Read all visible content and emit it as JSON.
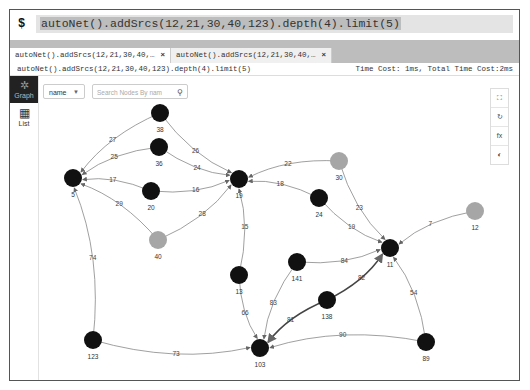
{
  "command_bar": {
    "prompt": "$",
    "query": "autoNet().addSrcs(12,21,30,40,123).depth(4).limit(5)"
  },
  "tabs": [
    {
      "label": "autoNet().addSrcs(12,21,30,40,…",
      "close": "×",
      "active": true
    },
    {
      "label": "autoNet().addSrcs(12,21,30,40,…",
      "close": "×",
      "active": false
    }
  ],
  "info_bar": {
    "query": "autoNet().addSrcs(12,21,30,40,123).depth(4).limit(5)",
    "timing": "Time Cost: 1ms, Total Time Cost:2ms"
  },
  "sidebar": {
    "items": [
      {
        "label": "Graph",
        "icon": "graph-icon",
        "active": true
      },
      {
        "label": "List",
        "icon": "table-icon",
        "active": false
      }
    ]
  },
  "controls": {
    "field_select": "name",
    "search_placeholder": "Search Nodes By nam"
  },
  "toolbar": {
    "items": [
      {
        "icon": "fit-view-icon",
        "glyph": "⛶"
      },
      {
        "icon": "refresh-layout-icon",
        "glyph": "↻"
      },
      {
        "icon": "fx-icon",
        "glyph": "fx"
      },
      {
        "icon": "snapshot-icon",
        "glyph": "◐"
      }
    ]
  },
  "colors": {
    "node_default": "#111111",
    "node_source": "#a6a6a6",
    "edge": "#888888",
    "sidebar_active_bg": "#222222"
  },
  "graph": {
    "nodes": [
      {
        "id": "38",
        "x": 160,
        "y": 113,
        "source": false
      },
      {
        "id": "36",
        "x": 159,
        "y": 147,
        "source": false
      },
      {
        "id": "5",
        "x": 73,
        "y": 178,
        "source": false
      },
      {
        "id": "20",
        "x": 151,
        "y": 191,
        "source": false
      },
      {
        "id": "19",
        "x": 239,
        "y": 179,
        "source": false
      },
      {
        "id": "40",
        "x": 158,
        "y": 240,
        "source": true
      },
      {
        "id": "30",
        "x": 339,
        "y": 161,
        "source": true
      },
      {
        "id": "24",
        "x": 319,
        "y": 198,
        "source": false
      },
      {
        "id": "12",
        "x": 475,
        "y": 211,
        "source": true
      },
      {
        "id": "11",
        "x": 390,
        "y": 248,
        "source": false
      },
      {
        "id": "141",
        "x": 297,
        "y": 262,
        "source": false
      },
      {
        "id": "13",
        "x": 239,
        "y": 275,
        "source": false
      },
      {
        "id": "138",
        "x": 327,
        "y": 300,
        "source": false
      },
      {
        "id": "123",
        "x": 93,
        "y": 340,
        "source": false
      },
      {
        "id": "103",
        "x": 260,
        "y": 348,
        "source": false
      },
      {
        "id": "89",
        "x": 426,
        "y": 342,
        "source": false
      }
    ],
    "edges": [
      {
        "from": "38",
        "to": "5",
        "label": "27"
      },
      {
        "from": "38",
        "to": "19",
        "label": "26"
      },
      {
        "from": "36",
        "to": "5",
        "label": "25"
      },
      {
        "from": "36",
        "to": "19",
        "label": "24"
      },
      {
        "from": "20",
        "to": "5",
        "label": "17"
      },
      {
        "from": "20",
        "to": "19",
        "label": "16"
      },
      {
        "from": "40",
        "to": "5",
        "label": "29"
      },
      {
        "from": "40",
        "to": "19",
        "label": "28"
      },
      {
        "from": "30",
        "to": "19",
        "label": "22"
      },
      {
        "from": "24",
        "to": "19",
        "label": "18"
      },
      {
        "from": "30",
        "to": "11",
        "label": "23"
      },
      {
        "from": "24",
        "to": "11",
        "label": "19"
      },
      {
        "from": "12",
        "to": "11",
        "label": "7"
      },
      {
        "from": "13",
        "to": "19",
        "label": "15"
      },
      {
        "from": "141",
        "to": "11",
        "label": "84"
      },
      {
        "from": "138",
        "to": "11",
        "label": "82"
      },
      {
        "from": "89",
        "to": "11",
        "label": "54"
      },
      {
        "from": "123",
        "to": "5",
        "label": "74"
      },
      {
        "from": "13",
        "to": "103",
        "label": "66"
      },
      {
        "from": "141",
        "to": "103",
        "label": "83"
      },
      {
        "from": "138",
        "to": "103",
        "label": "81"
      },
      {
        "from": "123",
        "to": "103",
        "label": "73"
      },
      {
        "from": "89",
        "to": "103",
        "label": "90"
      }
    ]
  }
}
